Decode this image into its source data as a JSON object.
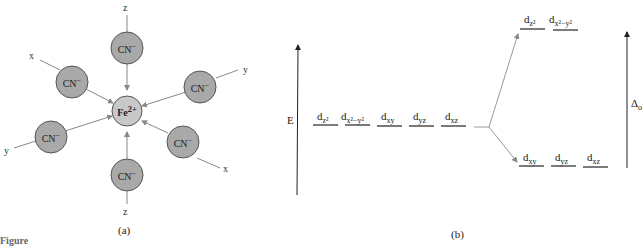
{
  "panel_a": {
    "caption": "(a)",
    "center_ion": {
      "label": "Fe",
      "charge": "2+"
    },
    "ligands": [
      {
        "label": "CN",
        "charge": "−",
        "axis": "z"
      },
      {
        "label": "CN",
        "charge": "−",
        "axis": "x"
      },
      {
        "label": "CN",
        "charge": "−",
        "axis": "y"
      },
      {
        "label": "CN",
        "charge": "−",
        "axis": "y"
      },
      {
        "label": "CN",
        "charge": "−",
        "axis": "x"
      },
      {
        "label": "CN",
        "charge": "−",
        "axis": "z"
      }
    ],
    "axis_labels": {
      "z_top": "z",
      "z_bottom": "z",
      "x_top": "x",
      "x_bottom": "x",
      "y_right": "y",
      "y_left": "y"
    },
    "colors": {
      "ligand_fill": "#a9a9a9",
      "center_fill": "#c8c8c8",
      "line": "#888888"
    }
  },
  "panel_b": {
    "caption": "(b)",
    "energy_axis_label": "E",
    "splitting_label": "Δ",
    "splitting_sub": "o",
    "degenerate_orbitals": [
      {
        "base": "d",
        "sub": "z²"
      },
      {
        "base": "d",
        "sub": "x²−y²"
      },
      {
        "base": "d",
        "sub": "xy"
      },
      {
        "base": "d",
        "sub": "yz"
      },
      {
        "base": "d",
        "sub": "xz"
      }
    ],
    "eg_orbitals": [
      {
        "base": "d",
        "sub": "z²"
      },
      {
        "base": "d",
        "sub": "x²−y²"
      }
    ],
    "t2g_orbitals": [
      {
        "base": "d",
        "sub": "xy"
      },
      {
        "base": "d",
        "sub": "yz"
      },
      {
        "base": "d",
        "sub": "xz"
      }
    ]
  },
  "footer_partial_text": "Figure"
}
